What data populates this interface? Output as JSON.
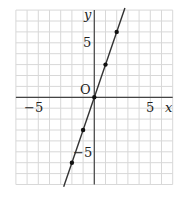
{
  "chart_data": {
    "type": "line",
    "title": "",
    "xlabel": "x",
    "ylabel": "y",
    "origin_label": "O",
    "xlim": [
      -7,
      7
    ],
    "ylim": [
      -8,
      8
    ],
    "grid": true,
    "x_ticks": [
      {
        "value": -5,
        "label": "−5"
      },
      {
        "value": 5,
        "label": "5"
      }
    ],
    "y_ticks": [
      {
        "value": 5,
        "label": "5"
      },
      {
        "value": -5,
        "label": "−5"
      }
    ],
    "series": [
      {
        "name": "y = 3x",
        "equation": "y = 3x",
        "points": [
          {
            "x": -2,
            "y": -6
          },
          {
            "x": -1,
            "y": -3
          },
          {
            "x": 0,
            "y": 0
          },
          {
            "x": 1,
            "y": 3
          },
          {
            "x": 2,
            "y": 6
          }
        ],
        "color": "#333333"
      }
    ]
  },
  "colors": {
    "grid": "#d8d8d8",
    "axis": "#444444",
    "line": "#333333"
  }
}
